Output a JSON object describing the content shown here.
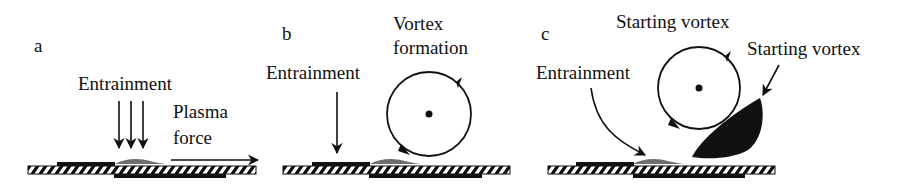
{
  "panels": [
    {
      "id": "a",
      "label": "a",
      "texts": {
        "entrainment": "Entrainment",
        "plasma_line1": "Plasma",
        "plasma_line2": "force"
      }
    },
    {
      "id": "b",
      "label": "b",
      "texts": {
        "entrainment": "Entrainment",
        "vortex_line1": "Vortex",
        "vortex_line2": "formation"
      }
    },
    {
      "id": "c",
      "label": "c",
      "texts": {
        "entrainment": "Entrainment",
        "starting_vortex_1": "Starting vortex",
        "starting_vortex_2": "Starting vortex"
      }
    }
  ],
  "colors": {
    "ink": "#111111",
    "plasma": "#6e6e6e",
    "background": "#ffffff"
  }
}
